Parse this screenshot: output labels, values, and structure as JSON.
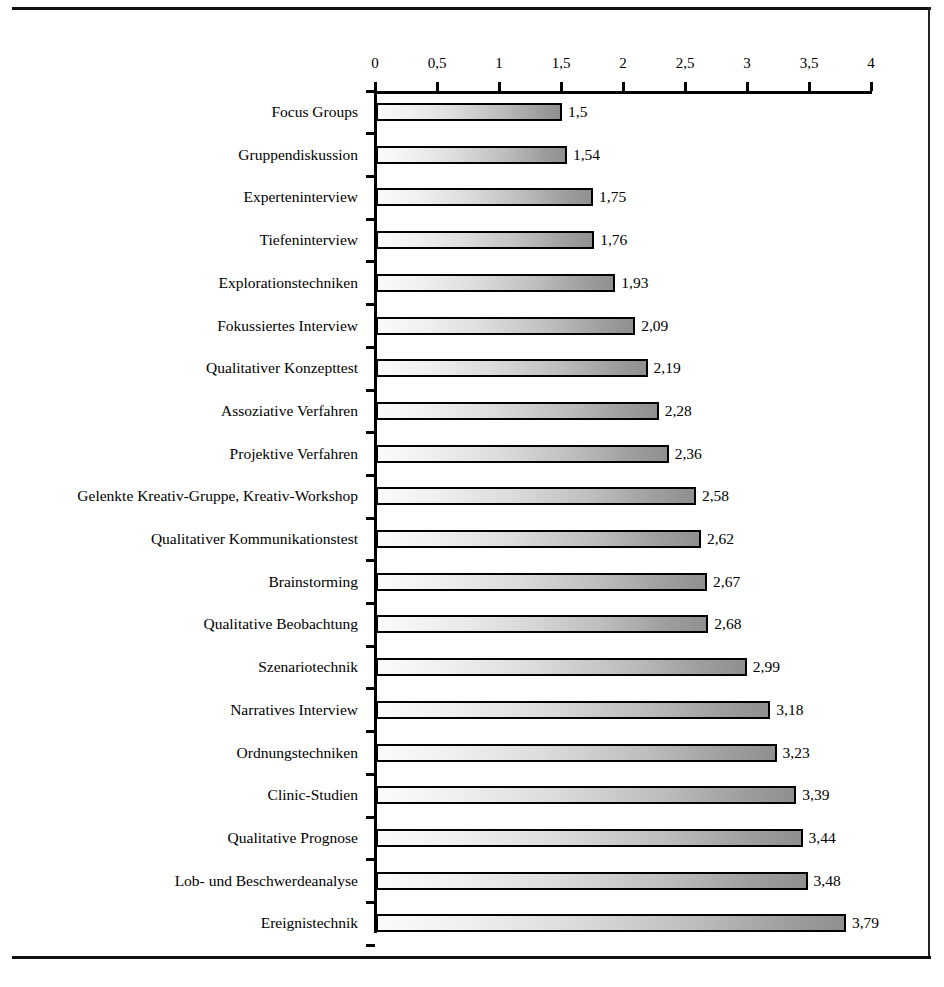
{
  "chart_data": {
    "type": "bar",
    "orientation": "horizontal",
    "title": "",
    "xlabel": "",
    "ylabel": "",
    "xlim": [
      0,
      4
    ],
    "grid": false,
    "legend": null,
    "decimal_separator": ",",
    "axis_ticks": [
      "0",
      "0,5",
      "1",
      "1,5",
      "2",
      "2,5",
      "3",
      "3,5",
      "4"
    ],
    "axis_tick_values": [
      0,
      0.5,
      1,
      1.5,
      2,
      2.5,
      3,
      3.5,
      4
    ],
    "categories": [
      "Focus Groups",
      "Gruppendiskussion",
      "Experteninterview",
      "Tiefeninterview",
      "Explorationstechniken",
      "Fokussiertes Interview",
      "Qualitativer Konzepttest",
      "Assoziative Verfahren",
      "Projektive Verfahren",
      "Gelenkte Kreativ-Gruppe, Kreativ-Workshop",
      "Qualitativer Kommunikationstest",
      "Brainstorming",
      "Qualitative Beobachtung",
      "Szenariotechnik",
      "Narratives Interview",
      "Ordnungstechniken",
      "Clinic-Studien",
      "Qualitative Prognose",
      "Lob- und Beschwerdeanalyse",
      "Ereignistechnik"
    ],
    "values": [
      1.5,
      1.54,
      1.75,
      1.76,
      1.93,
      2.09,
      2.19,
      2.28,
      2.36,
      2.58,
      2.62,
      2.67,
      2.68,
      2.99,
      3.18,
      3.23,
      3.39,
      3.44,
      3.48,
      3.79
    ],
    "value_labels": [
      "1,5",
      "1,54",
      "1,75",
      "1,76",
      "1,93",
      "2,09",
      "2,19",
      "2,28",
      "2,36",
      "2,58",
      "2,62",
      "2,67",
      "2,68",
      "2,99",
      "3,18",
      "3,23",
      "3,39",
      "3,44",
      "3,48",
      "3,79"
    ]
  },
  "style": {
    "bar_fill_light": "#fbfbfb",
    "bar_fill_dark": "#8f8f8f",
    "bar_border": "#000000",
    "axis_color": "#000000",
    "rule_color": "#111111",
    "background": "#ffffff"
  }
}
